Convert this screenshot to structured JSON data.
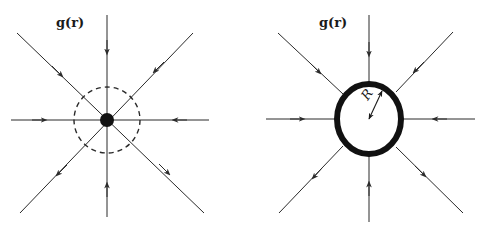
{
  "diagrams": [
    {
      "id": "point-mass",
      "label": "g(r)",
      "center": [
        107,
        120
      ],
      "source": "point mass (filled dot)",
      "gaussian_surface": "dashed circle",
      "field_lines": 8,
      "field_direction": "inward"
    },
    {
      "id": "spherical-shell",
      "label": "g(r)",
      "center": [
        369,
        119
      ],
      "source": "thick spherical shell",
      "radius_label": "R",
      "field_lines": 8,
      "field_direction": "inward"
    }
  ],
  "colors": {
    "line": "#2a2a2a",
    "fill": "#111111",
    "background": "#ffffff"
  }
}
